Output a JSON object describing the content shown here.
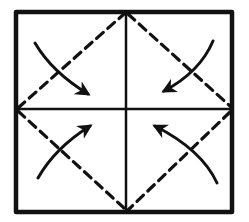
{
  "diagram": {
    "type": "origami-fold-diagram",
    "colors": {
      "ink": "#111111",
      "background": "#ffffff"
    },
    "square": {
      "x1": 16,
      "y1": 12,
      "x2": 232,
      "y2": 212
    },
    "center": {
      "x": 126,
      "y": 109
    },
    "crease_lines": [
      {
        "name": "vertical-crease",
        "style": "solid"
      },
      {
        "name": "horizontal-crease",
        "style": "solid"
      }
    ],
    "fold_lines": [
      {
        "name": "fold-line-top-left",
        "style": "dashed"
      },
      {
        "name": "fold-line-top-right",
        "style": "dashed"
      },
      {
        "name": "fold-line-bottom-right",
        "style": "dashed"
      },
      {
        "name": "fold-line-bottom-left",
        "style": "dashed"
      }
    ],
    "arrows": [
      {
        "name": "arrow-top-left-to-center",
        "direction": "down-right"
      },
      {
        "name": "arrow-top-right-to-center",
        "direction": "down-left"
      },
      {
        "name": "arrow-bottom-left-to-center",
        "direction": "up-right"
      },
      {
        "name": "arrow-bottom-right-to-center",
        "direction": "up-left"
      }
    ],
    "caption": "Fold all four corners to the center"
  }
}
